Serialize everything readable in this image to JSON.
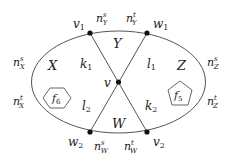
{
  "diagram": {
    "type": "planar-graph",
    "outer_curve": "ellipse",
    "vertices": [
      {
        "id": "v1",
        "label": "v",
        "sub": "1",
        "x": 90,
        "y": 33
      },
      {
        "id": "w1",
        "label": "w",
        "sub": "1",
        "x": 147,
        "y": 33
      },
      {
        "id": "v",
        "label": "v",
        "sub": "",
        "x": 118,
        "y": 82
      },
      {
        "id": "w2",
        "label": "w",
        "sub": "2",
        "x": 90,
        "y": 132
      },
      {
        "id": "v2",
        "label": "v",
        "sub": "2",
        "x": 147,
        "y": 132
      }
    ],
    "edges": [
      {
        "from": "v1",
        "to": "v",
        "label": "k",
        "sub": "1"
      },
      {
        "from": "w1",
        "to": "v",
        "label": "l",
        "sub": "1"
      },
      {
        "from": "w2",
        "to": "v",
        "label": "l",
        "sub": "2"
      },
      {
        "from": "v2",
        "to": "v",
        "label": "k",
        "sub": "2"
      }
    ],
    "regions": [
      {
        "id": "X",
        "label": "X"
      },
      {
        "id": "Y",
        "label": "Y"
      },
      {
        "id": "Z",
        "label": "Z"
      },
      {
        "id": "W",
        "label": "W"
      }
    ],
    "faces": [
      {
        "id": "f6",
        "label": "f",
        "sub": "6",
        "shape": "hexagon"
      },
      {
        "id": "f5",
        "label": "f",
        "sub": "5",
        "shape": "pentagon"
      }
    ],
    "boundary_labels": [
      {
        "id": "nsY",
        "base": "n",
        "sup": "s",
        "sub": "Y"
      },
      {
        "id": "ntY",
        "base": "n",
        "sup": "t",
        "sub": "Y"
      },
      {
        "id": "nsX",
        "base": "n",
        "sup": "s",
        "sub": "X"
      },
      {
        "id": "ntX",
        "base": "n",
        "sup": "t",
        "sub": "X"
      },
      {
        "id": "nsZ",
        "base": "n",
        "sup": "s",
        "sub": "Z"
      },
      {
        "id": "ntZ",
        "base": "n",
        "sup": "t",
        "sub": "Z"
      },
      {
        "id": "nsW",
        "base": "n",
        "sup": "s",
        "sub": "W"
      },
      {
        "id": "ntW",
        "base": "n",
        "sup": "t",
        "sub": "W"
      }
    ]
  }
}
